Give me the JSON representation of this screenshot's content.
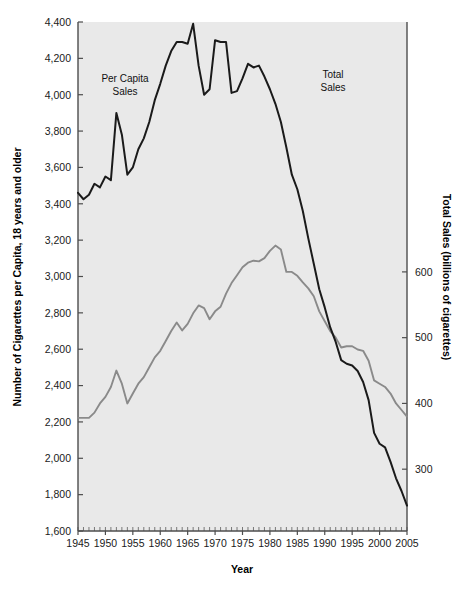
{
  "chart_data": {
    "type": "line",
    "title": "",
    "xlabel": "Year",
    "ylabel_left": "Number of Cigarettes per Capita, 18 years and older",
    "ylabel_right": "Total Sales (billions of cigarettes)",
    "xlim": [
      1945,
      2005
    ],
    "xticks": [
      1945,
      1950,
      1955,
      1960,
      1965,
      1970,
      1975,
      1980,
      1985,
      1990,
      1995,
      2000,
      2005
    ],
    "xticklabels": [
      "1945",
      "1950",
      "1955",
      "1960",
      "1965",
      "1970",
      "1975",
      "1980",
      "1985",
      "1990",
      "1995",
      "2000",
      "2005"
    ],
    "minor_xtick_interval": 1,
    "ylim_left": [
      1600,
      4400
    ],
    "yticks_left": [
      1600,
      1800,
      2000,
      2200,
      2400,
      2600,
      2800,
      3000,
      3200,
      3400,
      3600,
      3800,
      4000,
      4200,
      4400
    ],
    "yticklabels_left": [
      "1,600",
      "1,800",
      "2,000",
      "2,200",
      "2,400",
      "2,600",
      "2,800",
      "3,000",
      "3,200",
      "3,400",
      "3,600",
      "3,800",
      "4,000",
      "4,200",
      "4,400"
    ],
    "ylim_right": [
      206,
      980
    ],
    "yticks_right": [
      300,
      400,
      500,
      600
    ],
    "yticklabels_right": [
      "300",
      "400",
      "500",
      "600"
    ],
    "grid": false,
    "legend_position": "inline-annotations",
    "annotations": [
      {
        "text": "Per Capita Sales",
        "line1": "Per Capita",
        "line2": "Sales",
        "x": 1952.5,
        "y_px": 82,
        "series": "per_capita"
      },
      {
        "text": "Total Sales",
        "line1": "Total",
        "line2": "Sales",
        "x": 1987.0,
        "y_px": 78,
        "series": "total"
      }
    ],
    "series": [
      {
        "name": "Per Capita Sales",
        "axis": "left",
        "color": "#1a1a1a",
        "unit": "cigarettes per capita (18+)",
        "x": [
          1945,
          1946,
          1947,
          1948,
          1949,
          1950,
          1951,
          1952,
          1953,
          1954,
          1955,
          1956,
          1957,
          1958,
          1959,
          1960,
          1961,
          1962,
          1963,
          1964,
          1965,
          1966,
          1967,
          1968,
          1969,
          1970,
          1971,
          1972,
          1973,
          1974,
          1975,
          1976,
          1977,
          1978,
          1979,
          1980,
          1981,
          1982,
          1983,
          1984,
          1985,
          1986,
          1987,
          1988,
          1989,
          1990,
          1991,
          1992,
          1993,
          1994,
          1995,
          1996,
          1997,
          1998,
          1999,
          2000,
          2001,
          2002,
          2003,
          2004,
          2005
        ],
        "values": [
          3460,
          3425,
          3450,
          3510,
          3490,
          3550,
          3530,
          3900,
          3780,
          3560,
          3600,
          3700,
          3760,
          3850,
          3970,
          4060,
          4160,
          4240,
          4290,
          4290,
          4280,
          4390,
          4160,
          4000,
          4030,
          4300,
          4290,
          4290,
          4010,
          4020,
          4090,
          4170,
          4150,
          4160,
          4100,
          4030,
          3950,
          3850,
          3710,
          3560,
          3480,
          3360,
          3210,
          3070,
          2930,
          2830,
          2720,
          2640,
          2540,
          2520,
          2510,
          2480,
          2420,
          2320,
          2140,
          2080,
          2060,
          1980,
          1890,
          1820,
          1740
        ]
      },
      {
        "name": "Total Sales",
        "axis": "right",
        "color": "#8a8a8a",
        "unit": "billions of cigarettes",
        "x": [
          1945,
          1946,
          1947,
          1948,
          1949,
          1950,
          1951,
          1952,
          1953,
          1954,
          1955,
          1956,
          1957,
          1958,
          1959,
          1960,
          1961,
          1962,
          1963,
          1964,
          1965,
          1966,
          1967,
          1968,
          1969,
          1970,
          1971,
          1972,
          1973,
          1974,
          1975,
          1976,
          1977,
          1978,
          1979,
          1980,
          1981,
          1982,
          1983,
          1984,
          1985,
          1986,
          1987,
          1988,
          1989,
          1990,
          1991,
          1992,
          1993,
          1994,
          1995,
          1996,
          1997,
          1998,
          1999,
          2000,
          2001,
          2002,
          2003,
          2004,
          2005
        ],
        "values": [
          378,
          378,
          378,
          386,
          400,
          410,
          425,
          450,
          430,
          400,
          415,
          430,
          440,
          455,
          470,
          480,
          495,
          510,
          523,
          511,
          521,
          537,
          549,
          545,
          528,
          540,
          547,
          567,
          583,
          595,
          607,
          614,
          617,
          616,
          621,
          632,
          640,
          634,
          600,
          600,
          594,
          584,
          575,
          563,
          540,
          525,
          510,
          500,
          485,
          487,
          487,
          482,
          480,
          465,
          435,
          430,
          425,
          415,
          400,
          390,
          380
        ]
      }
    ]
  },
  "axes": {
    "left_title": "Number of Cigarettes per Capita, 18 years and older",
    "right_title": "Total Sales (billions of cigarettes)",
    "bottom_title": "Year"
  },
  "colors": {
    "per_capita_line": "#1a1a1a",
    "total_line": "#8a8a8a",
    "plot_background": "#e9e9e9",
    "axis": "#4d4d4d",
    "page_background": "#ffffff"
  }
}
